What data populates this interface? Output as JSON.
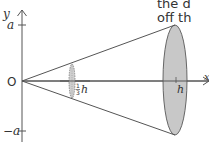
{
  "figure": {
    "type": "cone-of-revolution",
    "axes": {
      "y_label": "y",
      "x_label": "x",
      "origin_label": "O",
      "y_tick_top": "a",
      "y_tick_bottom": "−a"
    },
    "slices": [
      {
        "label_num": "1",
        "label_den": "3",
        "label_var": "h",
        "position": "one third of height"
      },
      {
        "label": "h",
        "position": "full height"
      }
    ],
    "colors": {
      "stroke": "#555555",
      "ellipse_fill": "#c8c8c8",
      "text": "#333333"
    }
  },
  "overflow_text": {
    "line1": "the d",
    "line2": "off th"
  }
}
